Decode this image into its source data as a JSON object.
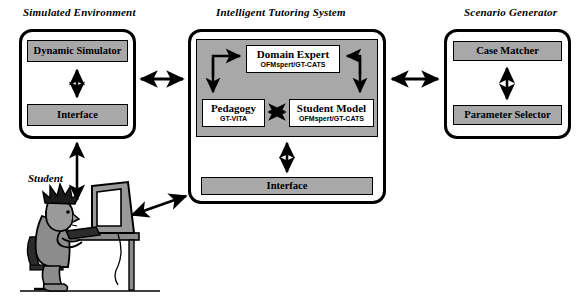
{
  "diagram": {
    "title_left": "Simulated Environment",
    "title_center": "Intelligent Tutoring System",
    "title_right": "Scenario Generator",
    "student_label": "Student"
  },
  "simulated_environment": {
    "boxes": [
      {
        "label": "Dynamic Simulator"
      },
      {
        "label": "Interface"
      }
    ]
  },
  "intelligent_tutoring_system": {
    "modules": [
      {
        "title": "Domain Expert",
        "subtitle": "OFMspert/GT-CATS"
      },
      {
        "title": "Pedagogy",
        "subtitle": "GT-VITA"
      },
      {
        "title": "Student Model",
        "subtitle": "OFMspert/GT-CATS"
      }
    ],
    "interface": {
      "label": "Interface"
    }
  },
  "scenario_generator": {
    "boxes": [
      {
        "label": "Case Matcher"
      },
      {
        "label": "Parameter Selector"
      }
    ]
  },
  "colors": {
    "fill_gray": "#a8a8a8",
    "stroke": "#000000",
    "background": "#ffffff"
  }
}
